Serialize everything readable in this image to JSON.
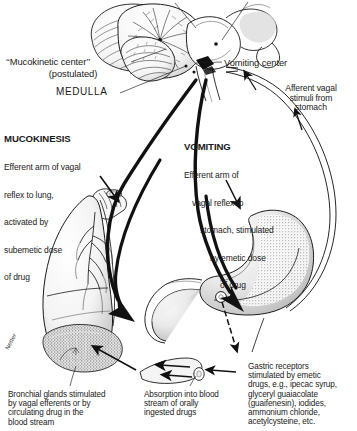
{
  "figure": {
    "signature": "Netter"
  },
  "labels": {
    "mucokinetic_center": "‘‘Mucokinetic center’’",
    "mucokinetic_center_sub": "(postulated)",
    "medulla": "MEDULLA",
    "vomiting_center": "Vomiting center",
    "afferent_vagal": "Afferent vagal\nstimuli from\nstomach"
  },
  "mucokinesis": {
    "title": "MUCOKINESIS",
    "line1": "Efferent arm of vagal",
    "line2": "reflex to lung,",
    "line3": "activated by",
    "line4": "subemetic dose",
    "line5": "of drug"
  },
  "vomiting": {
    "title": "VOMITING",
    "line1": "Efferent arm of",
    "line2": "vagal reflex to",
    "line3": "stomach, stimulated",
    "line4": "by emetic dose",
    "line5": "of drug"
  },
  "captions": {
    "bronchial": "Bronchial glands stimulated\nby vagal efferents or by\ncirculating drug in the\nblood stream",
    "absorption": "Absorption into blood\nstream of orally\ningested drugs",
    "gastric": "Gastric receptors\nstimulated by emetic\ndrugs, e.g., ipecac syrup,\nglyceryl guaiacolate\n(guaifenesin), iodides,\nammonium chloride,\nacetylcysteine, etc."
  },
  "anatomy": {
    "brain": "cerebellum-brainstem",
    "lung": "left-lung-with-trachea-and-bronchial-tree",
    "stomach": "stomach-with-duodenum",
    "vessel": "blood-vessel-segment"
  },
  "colors": {
    "ink": "#1a1a1a",
    "paper": "#ffffff",
    "shade": "#8d8d8d",
    "light_shade": "#c9c9c9"
  }
}
